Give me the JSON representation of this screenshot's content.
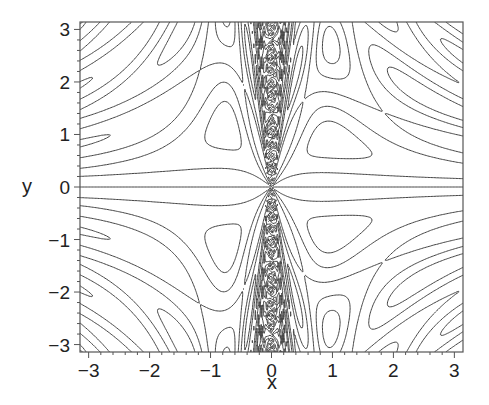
{
  "chart_data": {
    "type": "contour",
    "title": "",
    "xlabel": "x",
    "ylabel": "y",
    "xlim": [
      -3.14159,
      3.14159
    ],
    "ylim": [
      -3.14159,
      3.14159
    ],
    "x_ticks": [
      {
        "value": -3,
        "label": "−3"
      },
      {
        "value": -2,
        "label": "−2"
      },
      {
        "value": -1,
        "label": "−1"
      },
      {
        "value": 0,
        "label": "0"
      },
      {
        "value": 1,
        "label": "1"
      },
      {
        "value": 2,
        "label": "2"
      },
      {
        "value": 3,
        "label": "3"
      }
    ],
    "y_ticks": [
      {
        "value": 3,
        "label": "3"
      },
      {
        "value": 2,
        "label": "2"
      },
      {
        "value": 1,
        "label": "1"
      },
      {
        "value": 0,
        "label": "0"
      },
      {
        "value": -1,
        "label": "−1"
      },
      {
        "value": -2,
        "label": "−2"
      },
      {
        "value": -3,
        "label": "−3"
      }
    ],
    "minor_ticks_per_unit": 5,
    "grid": false,
    "legend": null,
    "contour_levels": [
      -0.9,
      -0.5,
      0.0,
      0.5,
      0.9
    ],
    "line_color": "#444444",
    "frame_color": "#555555"
  },
  "layout": {
    "frame": {
      "left": 80,
      "top": 22,
      "right": 463,
      "bottom": 352
    }
  }
}
